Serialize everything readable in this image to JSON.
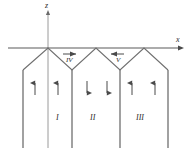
{
  "figure": {
    "type": "magnetic-domain-diagram",
    "background_color": "#ffffff",
    "line_color": "#6f6f6f",
    "axis_color": "#5a5a5a",
    "text_color": "#2b2b2b"
  },
  "axes": {
    "vertical": {
      "label": "z",
      "label_x": 47,
      "label_y": 3,
      "x": 48,
      "y_top": 12,
      "y_bottom": 148
    },
    "horizontal": {
      "label": "x",
      "label_x": 178,
      "label_y": 38,
      "y": 48,
      "x_left": 8,
      "x_right": 183
    }
  },
  "walls": {
    "zigzag_peaks_x": [
      48,
      96,
      144
    ],
    "zigzag_valleys_x": [
      72,
      120
    ],
    "valley_y": 70,
    "peak_y": 48,
    "outer_left_x": 23,
    "outer_right_x": 168,
    "vertical_lines_x": [
      23,
      48,
      72,
      120,
      168
    ],
    "vertical_bottom_y": 148
  },
  "regions": [
    {
      "label": "I",
      "x": 58,
      "y": 118,
      "magnetization": "up"
    },
    {
      "label": "II",
      "x": 93,
      "y": 118,
      "magnetization": "down"
    },
    {
      "label": "III",
      "x": 140,
      "y": 118,
      "magnetization": "up"
    }
  ],
  "closure_domains": [
    {
      "label": "IV",
      "x": 69,
      "y": 60,
      "arrow": "right",
      "arrow_x": 68,
      "arrow_y": 53
    },
    {
      "label": "V",
      "x": 118,
      "y": 60,
      "arrow": "left",
      "arrow_x": 116,
      "arrow_y": 53
    }
  ],
  "magnetization_arrows": [
    {
      "x": 35,
      "y": 88,
      "direction": "up",
      "region": "I"
    },
    {
      "x": 58,
      "y": 88,
      "direction": "up",
      "region": "I"
    },
    {
      "x": 87,
      "y": 88,
      "direction": "down",
      "region": "II"
    },
    {
      "x": 107,
      "y": 88,
      "direction": "down",
      "region": "II"
    },
    {
      "x": 132,
      "y": 88,
      "direction": "up",
      "region": "III"
    },
    {
      "x": 155,
      "y": 88,
      "direction": "up",
      "region": "III"
    }
  ]
}
